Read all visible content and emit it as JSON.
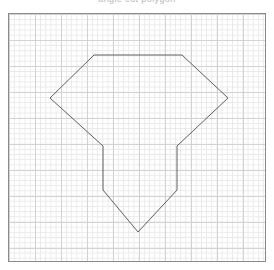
{
  "caption": {
    "text": "angle cut polygon"
  },
  "plot": {
    "frame": {
      "x": 8,
      "y": 13,
      "width": 258,
      "height": 249,
      "border_color": "#8a8a8a",
      "background_color": "#ffffff"
    },
    "grid": {
      "visible": true,
      "minor_spacing_px": 5.2,
      "major_spacing_px": 26,
      "minor_color": "#e9e9e9",
      "major_color": "#d3d3d6"
    }
  },
  "chart_data": {
    "type": "line",
    "title": "angle cut polygon",
    "xlabel": "",
    "ylabel": "",
    "grid": true,
    "legend": null,
    "shapes": [
      {
        "name": "diamond-shield-polygon",
        "closed": true,
        "stroke": "#5f5f5f",
        "stroke_width": 1,
        "fill": "none",
        "vertices": [
          [
            94,
            55
          ],
          [
            182,
            55
          ],
          [
            228,
            98
          ],
          [
            177,
            146
          ],
          [
            177,
            190
          ],
          [
            138,
            232
          ],
          [
            103,
            190
          ],
          [
            103,
            146
          ],
          [
            50,
            98
          ]
        ]
      }
    ],
    "xlim": [
      8,
      266
    ],
    "ylim": [
      262,
      13
    ]
  }
}
